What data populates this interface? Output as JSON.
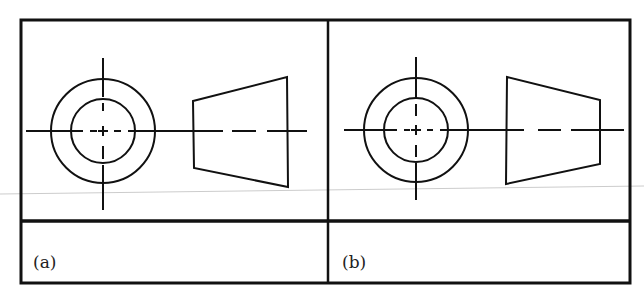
{
  "figure": {
    "panels": [
      {
        "id": "a",
        "label": "(a)",
        "trapezoid_orientation": "narrow-left-wide-right"
      },
      {
        "id": "b",
        "label": "(b)",
        "trapezoid_orientation": "wide-left-narrow-right"
      }
    ],
    "colors": {
      "line": "#111111",
      "background": "#ffffff"
    }
  }
}
